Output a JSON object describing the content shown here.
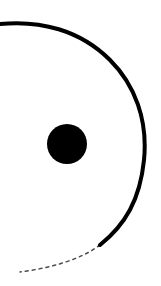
{
  "graphic": {
    "description": "Ink brush arc with central dot",
    "stroke_color": "#000000",
    "background": "#ffffff",
    "dot": {
      "cx": 67,
      "cy": 144,
      "r": 20
    }
  }
}
